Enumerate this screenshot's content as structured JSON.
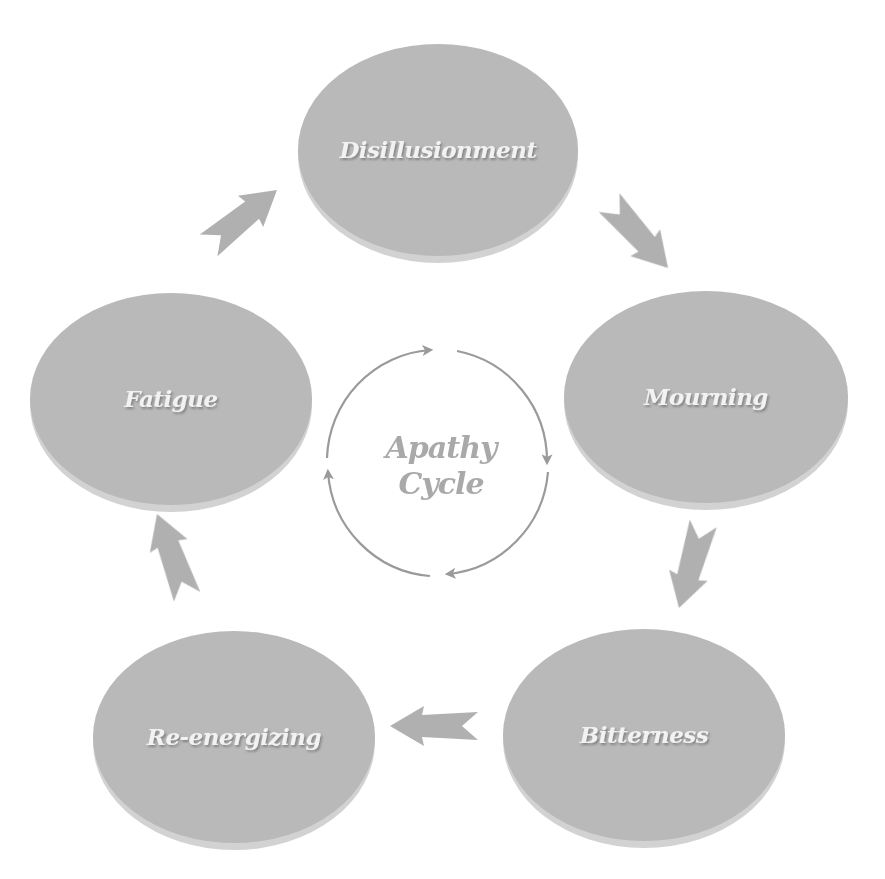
{
  "title": "Apathy Cycle",
  "center": {
    "line1": "Apathy",
    "line2": "Cycle"
  },
  "colors": {
    "node_fill": "#b9b9b9",
    "node_rim": "#d2d2d2",
    "node_text": "#f2f2f2",
    "node_text_shadow": "#7d7d7d",
    "arrow_fill": "#b0b0b0",
    "center_circle": "#9a9a9a",
    "center_text": "#a9a9a9"
  },
  "nodes": [
    {
      "id": "disillusionment",
      "label": "Disillusionment",
      "cx": 438,
      "cy": 150,
      "rx": 140,
      "ry": 108
    },
    {
      "id": "mourning",
      "label": "Mourning",
      "cx": 706,
      "cy": 397,
      "rx": 142,
      "ry": 108
    },
    {
      "id": "bitterness",
      "label": "Bitterness",
      "cx": 644,
      "cy": 735,
      "rx": 141,
      "ry": 108
    },
    {
      "id": "re-energizing",
      "label": "Re-energizing",
      "cx": 234,
      "cy": 737,
      "rx": 141,
      "ry": 109
    },
    {
      "id": "fatigue",
      "label": "Fatigue",
      "cx": 171,
      "cy": 399,
      "rx": 141,
      "ry": 108
    }
  ],
  "edges": [
    {
      "from": "Disillusionment",
      "to": "Mourning"
    },
    {
      "from": "Mourning",
      "to": "Bitterness"
    },
    {
      "from": "Bitterness",
      "to": "Re-energizing"
    },
    {
      "from": "Re-energizing",
      "to": "Fatigue"
    },
    {
      "from": "Fatigue",
      "to": "Disillusionment"
    }
  ]
}
